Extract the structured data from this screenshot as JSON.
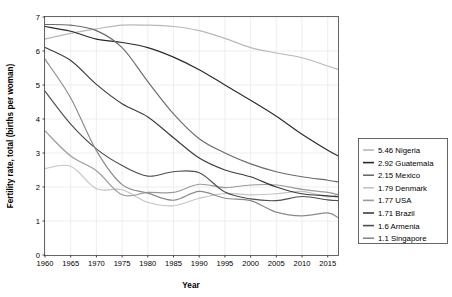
{
  "chart_data": {
    "type": "line",
    "title": "",
    "xlabel": "Year",
    "ylabel": "Fertility rate, total (births per woman)",
    "xlim": [
      1960,
      2017
    ],
    "ylim": [
      0,
      7
    ],
    "xticks": [
      1960,
      1965,
      1970,
      1975,
      1980,
      1985,
      1990,
      1995,
      2000,
      2005,
      2010,
      2015
    ],
    "yticks": [
      0,
      1,
      2,
      3,
      4,
      5,
      6,
      7
    ],
    "grid": true,
    "legend_position": "right-outside",
    "x": [
      1960,
      1965,
      1970,
      1975,
      1980,
      1985,
      1990,
      1995,
      2000,
      2005,
      2010,
      2015,
      2017
    ],
    "series": [
      {
        "name": "Nigeria",
        "legend_value": "5.46",
        "legend_label": "5.46 Nigeria",
        "color": "#b8b8b8",
        "values": [
          6.35,
          6.52,
          6.65,
          6.76,
          6.76,
          6.72,
          6.6,
          6.37,
          6.1,
          5.94,
          5.8,
          5.56,
          5.46
        ]
      },
      {
        "name": "Guatemala",
        "legend_value": "2.92",
        "legend_label": "2.92 Guatemala",
        "color": "#2a2a2a",
        "values": [
          6.72,
          6.58,
          6.35,
          6.25,
          6.1,
          5.82,
          5.45,
          5.0,
          4.55,
          4.08,
          3.55,
          3.08,
          2.92
        ]
      },
      {
        "name": "Mexico",
        "legend_value": "2.15",
        "legend_label": "2.15 Mexico",
        "color": "#6b6b6b",
        "values": [
          6.78,
          6.76,
          6.6,
          6.1,
          5.1,
          4.15,
          3.42,
          3.0,
          2.68,
          2.45,
          2.3,
          2.2,
          2.15
        ]
      },
      {
        "name": "Denmark",
        "legend_value": "1.79",
        "legend_label": "1.79 Denmark",
        "color": "#c4c4c4",
        "values": [
          2.54,
          2.61,
          1.95,
          1.92,
          1.55,
          1.45,
          1.67,
          1.81,
          1.77,
          1.8,
          1.87,
          1.71,
          1.79
        ]
      },
      {
        "name": "USA",
        "legend_value": "1.77",
        "legend_label": "1.77 USA",
        "color": "#9a9a9a",
        "values": [
          3.65,
          2.91,
          2.48,
          1.77,
          1.84,
          1.84,
          2.08,
          1.98,
          2.06,
          2.06,
          1.93,
          1.84,
          1.77
        ]
      },
      {
        "name": "Brazil",
        "legend_value": "1.71",
        "legend_label": "1.71 Brazil",
        "color": "#3c3c3c",
        "values": [
          6.1,
          5.72,
          5.02,
          4.45,
          4.06,
          3.45,
          2.85,
          2.5,
          2.3,
          2.0,
          1.8,
          1.74,
          1.71
        ]
      },
      {
        "name": "Armenia",
        "legend_value": "1.6",
        "legend_label": "1.6 Armenia",
        "color": "#4e4e4e",
        "values": [
          4.82,
          3.85,
          3.12,
          2.63,
          2.32,
          2.45,
          2.42,
          1.85,
          1.65,
          1.6,
          1.72,
          1.62,
          1.6
        ]
      },
      {
        "name": "Singapore",
        "legend_value": "1.1",
        "legend_label": "1.1 Singapore",
        "color": "#8a8a8a",
        "values": [
          5.76,
          4.62,
          3.07,
          2.07,
          1.82,
          1.61,
          1.87,
          1.67,
          1.6,
          1.26,
          1.15,
          1.24,
          1.1
        ]
      }
    ]
  },
  "axes": {
    "x_title": "Year",
    "y_title": "Fertility rate, total (births per woman)",
    "x_tick_labels": [
      "1960",
      "1965",
      "1970",
      "1975",
      "1980",
      "1985",
      "1990",
      "1995",
      "2000",
      "2005",
      "2010",
      "2015"
    ],
    "y_tick_labels": [
      "0",
      "1",
      "2",
      "3",
      "4",
      "5",
      "6",
      "7"
    ]
  },
  "legend": {
    "items": [
      {
        "label": "5.46 Nigeria",
        "color": "#b8b8b8"
      },
      {
        "label": "2.92 Guatemala",
        "color": "#2a2a2a"
      },
      {
        "label": "2.15 Mexico",
        "color": "#6b6b6b"
      },
      {
        "label": "1.79 Denmark",
        "color": "#c4c4c4"
      },
      {
        "label": "1.77 USA",
        "color": "#9a9a9a"
      },
      {
        "label": "1.71 Brazil",
        "color": "#3c3c3c"
      },
      {
        "label": "1.6 Armenia",
        "color": "#4e4e4e"
      },
      {
        "label": "1.1 Singapore",
        "color": "#8a8a8a"
      }
    ]
  },
  "colors": {
    "background": "#ffffff",
    "grid": "#e8e8ef",
    "frame": "#555555",
    "text": "#000000"
  }
}
